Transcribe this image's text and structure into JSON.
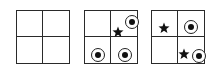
{
  "figure": {
    "panels": [
      {
        "id": "panel-1",
        "left": 16,
        "grid": "2x2",
        "items": []
      },
      {
        "id": "panel-2",
        "left": 84,
        "grid": "2x2",
        "items": [
          {
            "type": "target",
            "cell": "top-right",
            "x": 47,
            "y": 11
          },
          {
            "type": "star",
            "cell": "top-right",
            "x": 33,
            "y": 21
          },
          {
            "type": "target",
            "cell": "bottom-left",
            "x": 13,
            "y": 44
          },
          {
            "type": "target",
            "cell": "bottom-right",
            "x": 40,
            "y": 44
          }
        ]
      },
      {
        "id": "panel-3",
        "left": 151,
        "grid": "2x2",
        "items": [
          {
            "type": "star",
            "cell": "top-left",
            "x": 12,
            "y": 17
          },
          {
            "type": "target",
            "cell": "top-right",
            "x": 39,
            "y": 16
          },
          {
            "type": "star",
            "cell": "bottom-right",
            "x": 32,
            "y": 43
          },
          {
            "type": "target",
            "cell": "bottom-right",
            "x": 47,
            "y": 45
          }
        ]
      }
    ],
    "icons": {
      "target": "circle-with-dot-icon",
      "star": "star-icon"
    },
    "colors": {
      "line": "#2a2a2a",
      "fill": "#111111",
      "background": "#ffffff"
    }
  }
}
